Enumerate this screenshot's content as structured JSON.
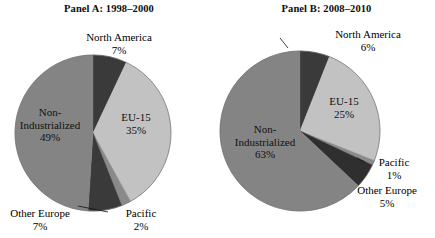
{
  "figure": {
    "panels": [
      {
        "id": "panel-a",
        "title": "Panel A: 1998–2000",
        "chart": {
          "type": "pie",
          "title": "Panel A: 1998–2000",
          "categories": [
            "North America",
            "EU-15",
            "Pacific",
            "Other Europe",
            "Non-Industrialized"
          ],
          "values": [
            7,
            35,
            2,
            7,
            49
          ],
          "value_suffix": "%",
          "start_angle_deg": 0,
          "direction": "clockwise",
          "colors": [
            "#3a3a3a",
            "#c2c2c2",
            "#8a8a8a",
            "#3a3a3a",
            "#848484"
          ],
          "labels": [
            {
              "name": "North America",
              "percent": "7%",
              "placement": "outside"
            },
            {
              "name": "EU-15",
              "percent": "35%",
              "placement": "inside"
            },
            {
              "name": "Pacific",
              "percent": "2%",
              "placement": "outside"
            },
            {
              "name": "Other Europe",
              "percent": "7%",
              "placement": "outside"
            },
            {
              "name": "Non-Industrialized",
              "percent": "49%",
              "placement": "inside"
            }
          ]
        }
      },
      {
        "id": "panel-b",
        "title": "Panel B: 2008–2010",
        "chart": {
          "type": "pie",
          "title": "Panel B: 2008–2010",
          "categories": [
            "North America",
            "EU-15",
            "Pacific",
            "Other Europe",
            "Non-Industrialized"
          ],
          "values": [
            6,
            25,
            1,
            5,
            63
          ],
          "value_suffix": "%",
          "start_angle_deg": 0,
          "direction": "clockwise",
          "colors": [
            "#3a3a3a",
            "#c2c2c2",
            "#8a8a8a",
            "#2f2f2f",
            "#848484"
          ],
          "labels": [
            {
              "name": "North America",
              "percent": "6%",
              "placement": "outside"
            },
            {
              "name": "EU-15",
              "percent": "25%",
              "placement": "inside"
            },
            {
              "name": "Pacific",
              "percent": "1%",
              "placement": "outside"
            },
            {
              "name": "Other Europe",
              "percent": "5%",
              "placement": "outside"
            },
            {
              "name": "Non-Industrialized",
              "percent": "63%",
              "placement": "inside"
            }
          ]
        }
      }
    ]
  },
  "chart_data": [
    {
      "type": "pie",
      "title": "Panel A: 1998–2000",
      "categories": [
        "North America",
        "EU-15",
        "Pacific",
        "Other Europe",
        "Non-Industrialized"
      ],
      "values": [
        7,
        35,
        2,
        7,
        49
      ],
      "unit": "percent",
      "legend": "none",
      "annotations": [
        "North America 7%",
        "EU-15 35%",
        "Pacific 2%",
        "Other Europe 7%",
        "Non-Industrialized 49%"
      ]
    },
    {
      "type": "pie",
      "title": "Panel B: 2008–2010",
      "categories": [
        "North America",
        "EU-15",
        "Pacific",
        "Other Europe",
        "Non-Industrialized"
      ],
      "values": [
        6,
        25,
        1,
        5,
        63
      ],
      "unit": "percent",
      "legend": "none",
      "annotations": [
        "North America 6%",
        "EU-15 25%",
        "Pacific 1%",
        "Other Europe 5%",
        "Non-Industrialized 63%"
      ]
    }
  ],
  "panel_a_labels": {
    "north_america": {
      "name": "North America",
      "percent": "7%"
    },
    "eu15": {
      "name": "EU-15",
      "percent": "35%"
    },
    "pacific": {
      "name": "Pacific",
      "percent": "2%"
    },
    "other_europe": {
      "name": "Other Europe",
      "percent": "7%"
    },
    "non_industrialized": {
      "name1": "Non-",
      "name2": "Industrialized",
      "percent": "49%"
    }
  },
  "panel_b_labels": {
    "north_america": {
      "name": "North America",
      "percent": "6%"
    },
    "eu15": {
      "name": "EU-15",
      "percent": "25%"
    },
    "pacific": {
      "name": "Pacific",
      "percent": "1%"
    },
    "other_europe": {
      "name": "Other Europe",
      "percent": "5%"
    },
    "non_industrialized": {
      "name1": "Non-",
      "name2": "Industrialized",
      "percent": "63%"
    }
  }
}
